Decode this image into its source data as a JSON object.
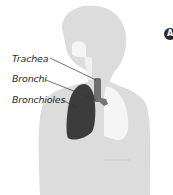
{
  "labels": {
    "trachea": "Trachea",
    "bronchi": "Bronchi",
    "bronchioles": "Bronchioles"
  },
  "badge": {
    "letter": "A"
  },
  "colors": {
    "silhouette": "#dcdcdc",
    "airway": "#f5f5f5",
    "lung": "#3c3c3c",
    "trachea": "#6e6e6e",
    "leader_line": "#333333",
    "badge": "#2b2b2b"
  }
}
